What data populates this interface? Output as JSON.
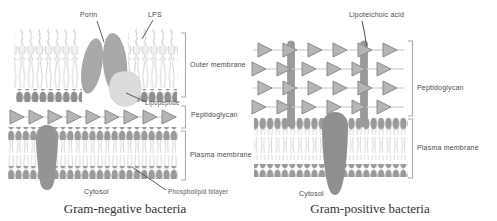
{
  "diagram": {
    "left": {
      "caption": "Gram-negative bacteria",
      "labels": {
        "porin": "Porin",
        "lps": "LPS",
        "outer_membrane": "Outer membrane",
        "lipopeptide": "Lipopeptide",
        "peptidoglycan": "Peptidoglycan",
        "plasma_membrane": "Plasma membrane",
        "cytosol": "Cytosol",
        "phospholipid_bilayer": "Phospholipid bilayer"
      }
    },
    "right": {
      "caption": "Gram-positive bacteria",
      "labels": {
        "lipoteichoic_acid": "Lipoteichoic acid",
        "peptidoglycan": "Peptidoglycan",
        "plasma_membrane": "Plasma membrane",
        "cytosol": "Cytosol"
      }
    },
    "colors": {
      "background": "#ffffff",
      "label_text": "#4a4a4a",
      "caption_text": "#333333",
      "lipid_light": "#c9c9c9",
      "lipid_head_dark": "#8f8f8f",
      "membrane_head": "#9a9a9a",
      "porin_fill": "#a8a8a8",
      "lipopeptide_fill": "#dcdcdc",
      "triangle_fill": "#b5b5b5",
      "triangle_stroke": "#8a8a8a",
      "protein_fill": "#949494",
      "rod_fill": "#9a9a9a",
      "bracket": "#a9a9a9",
      "leader_line": "#4d4d4d"
    }
  }
}
